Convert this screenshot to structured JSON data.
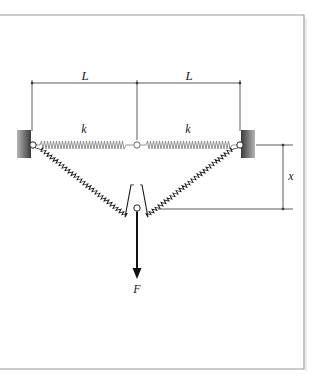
{
  "figure": {
    "labels": {
      "length_left": "L",
      "length_right": "L",
      "spring_left": "k",
      "spring_right": "k",
      "displacement": "x",
      "force": "F"
    },
    "colors": {
      "line": "#222222",
      "spring_unstretched": "#8a8a8a",
      "spring_stretched": "#1a1a1a",
      "wall_dark": "#3a3a3a",
      "wall_light": "#b0b0b0",
      "frame": "#9a9a9a"
    }
  }
}
